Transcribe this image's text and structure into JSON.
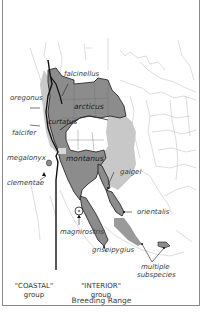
{
  "figure": {
    "caption": "Breeding Range",
    "colors": {
      "dark_range": "#8c8c8c",
      "light_range": "#c8c8c8",
      "boundary_line": "#1a1a1a",
      "state_lines": "#b5b5b5",
      "background": "#ffffff"
    }
  },
  "subspecies_labels": {
    "falcinellus": "falcinellus",
    "oregonus": "oregonus",
    "arcticus": "arcticus",
    "curtatus": "curtatus",
    "falcifer": "falcifer",
    "megalonyx": "megalonyx",
    "montanus": "montanus",
    "clementae": "clementae",
    "gaigei": "gaigei",
    "orientalis": "orientalis",
    "magnirostris": "magnirostris",
    "griseipygius": "griseipygius",
    "multiple": "multiple",
    "subspecies": "subspecies"
  },
  "groups": {
    "coastal_name": "\"COASTAL\"",
    "coastal_word": "group",
    "interior_name": "\"INTERIOR\"",
    "interior_word": "group"
  }
}
